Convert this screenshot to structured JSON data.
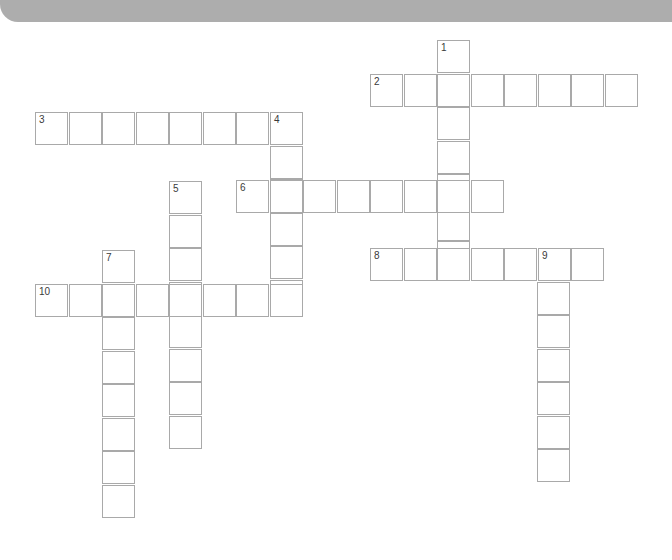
{
  "puzzle": {
    "type": "crossword",
    "cell_size": 33.5,
    "colors": {
      "banner": "#adadad",
      "cell_border": "#a9a9a9",
      "cell_fill": "#ffffff",
      "number": "#3a3a3a"
    },
    "entries": [
      {
        "number": "1",
        "direction": "down",
        "x": 437,
        "y": 40,
        "length": 7
      },
      {
        "number": "2",
        "direction": "across",
        "x": 370,
        "y": 74,
        "length": 8
      },
      {
        "number": "3",
        "direction": "across",
        "x": 35,
        "y": 112,
        "length": 8
      },
      {
        "number": "4",
        "direction": "down",
        "x": 270,
        "y": 112,
        "length": 6
      },
      {
        "number": "5",
        "direction": "down",
        "x": 169,
        "y": 181,
        "length": 8
      },
      {
        "number": "6",
        "direction": "across",
        "x": 236,
        "y": 180,
        "length": 8
      },
      {
        "number": "7",
        "direction": "down",
        "x": 102,
        "y": 250,
        "length": 8
      },
      {
        "number": "8",
        "direction": "across",
        "x": 370,
        "y": 248,
        "length": 7
      },
      {
        "number": "9",
        "direction": "down",
        "x": 537,
        "y": 248,
        "length": 7
      },
      {
        "number": "10",
        "direction": "across",
        "x": 35,
        "y": 284,
        "length": 8
      }
    ]
  }
}
